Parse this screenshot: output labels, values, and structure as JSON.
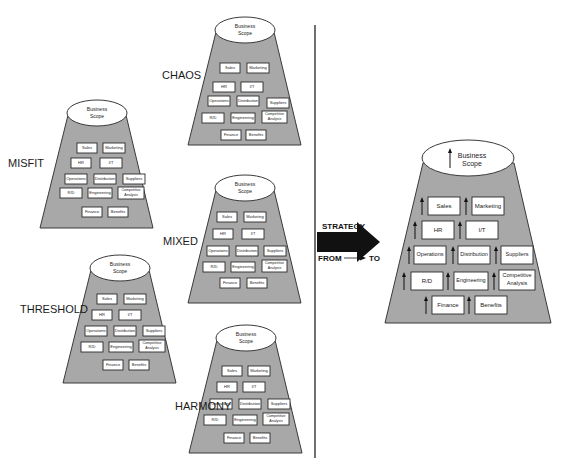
{
  "diagram": {
    "colors": {
      "background": "#ffffff",
      "trapezoid_fill": "#a8a8a8",
      "outline": "#3a3a3a",
      "arrow": "#111111"
    },
    "scope_label_line1": "Business",
    "scope_label_line2": "Scope",
    "functions": {
      "sales": "Sales",
      "marketing": "Marketing",
      "hr": "HR",
      "it": "I/T",
      "operations": "Operations",
      "distribution": "Distribution",
      "suppliers": "Suppliers",
      "rd": "R/D",
      "engineering": "Engineering",
      "competitive1": "Competitive",
      "competitive2": "Analysis",
      "finance": "Finance",
      "benefits": "Benefits"
    },
    "states": [
      {
        "name": "CHAOS"
      },
      {
        "name": "MISFIT"
      },
      {
        "name": "MIXED"
      },
      {
        "name": "THRESHOLD"
      },
      {
        "name": "HARMONY"
      }
    ],
    "transition": {
      "strategy": "STRATEGY",
      "from": "FROM",
      "to": "TO"
    },
    "target_state": {
      "scope_line1": "Business",
      "scope_line2": "Scope"
    }
  }
}
